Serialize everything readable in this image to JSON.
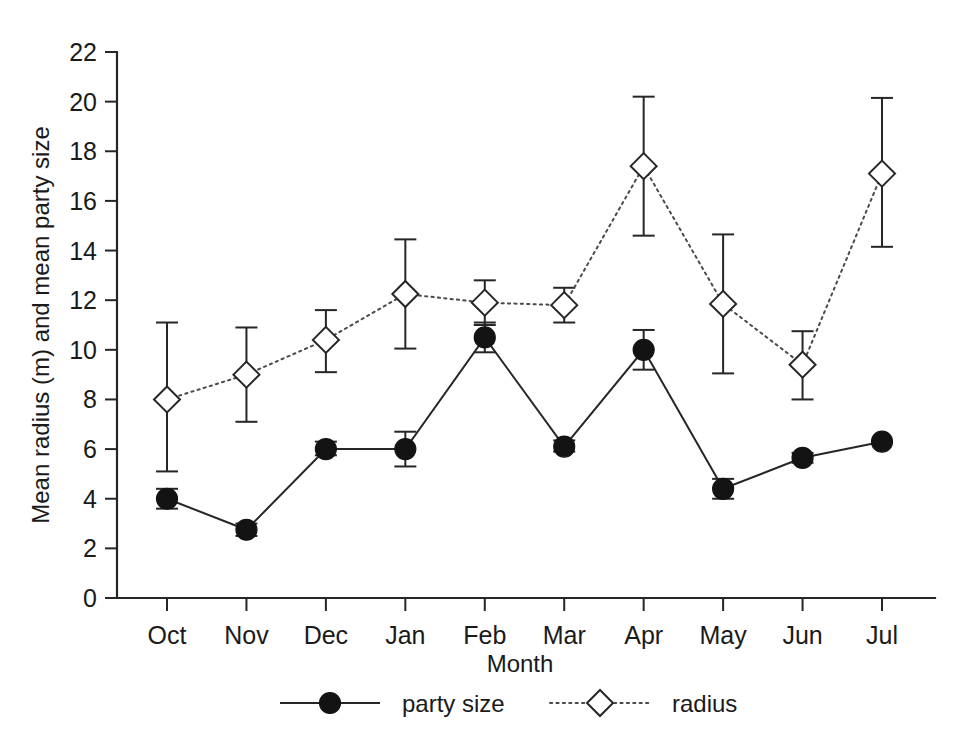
{
  "chart_data": {
    "type": "line",
    "title": "",
    "xlabel": "Month",
    "ylabel": "Mean radius (m) and mean party size",
    "categories": [
      "Oct",
      "Nov",
      "Dec",
      "Jan",
      "Feb",
      "Mar",
      "Apr",
      "May",
      "Jun",
      "Jul"
    ],
    "ylim": [
      0,
      22
    ],
    "yticks": [
      0,
      2,
      4,
      6,
      8,
      10,
      12,
      14,
      16,
      18,
      20,
      22
    ],
    "ytick_labels": [
      "0",
      "2",
      "4",
      "6",
      "8",
      "10",
      "12",
      "14",
      "16",
      "18",
      "20",
      "22"
    ],
    "grid": false,
    "legend_position": "bottom-center",
    "series": [
      {
        "name": "party size",
        "marker": "filled-circle",
        "line_style": "solid",
        "color": "#131313",
        "values": [
          4.0,
          2.75,
          6.0,
          6.0,
          10.5,
          6.1,
          10.0,
          4.4,
          5.65,
          6.3
        ],
        "err_low": [
          3.6,
          2.5,
          5.75,
          5.3,
          9.9,
          5.9,
          9.2,
          4.0,
          5.45,
          null
        ],
        "err_high": [
          4.4,
          3.0,
          6.3,
          6.7,
          11.1,
          6.35,
          10.8,
          4.8,
          5.85,
          null
        ]
      },
      {
        "name": "radius",
        "marker": "open-diamond",
        "line_style": "dotted",
        "color": "#4a4a4a",
        "values": [
          8.0,
          9.0,
          10.4,
          12.25,
          11.9,
          11.8,
          17.4,
          11.85,
          9.4,
          17.1
        ],
        "err_low": [
          5.1,
          7.1,
          9.1,
          10.05,
          11.0,
          11.1,
          14.6,
          9.05,
          8.0,
          14.15
        ],
        "err_high": [
          11.1,
          10.9,
          11.6,
          14.45,
          12.8,
          12.5,
          20.2,
          14.65,
          10.75,
          20.15
        ]
      }
    ]
  },
  "legend": {
    "items": [
      {
        "label": "party size"
      },
      {
        "label": "radius"
      }
    ]
  },
  "axes": {
    "x_title": "Month",
    "y_title": "Mean radius (m) and mean party size"
  }
}
